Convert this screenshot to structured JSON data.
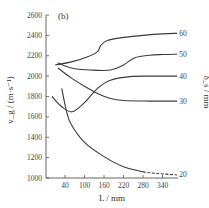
{
  "chart_data": {
    "type": "line",
    "panel_label": "(b)",
    "title": "",
    "xlabel": "L / mm",
    "ylabel": "v_g / (m·s⁻¹)",
    "right_label": "δ_s / mm",
    "xlim": [
      -20,
      380
    ],
    "ylim": [
      1000,
      2600
    ],
    "x_ticks": [
      40,
      100,
      160,
      220,
      280,
      340
    ],
    "y_ticks": [
      1000,
      1200,
      1400,
      1600,
      1800,
      2000,
      2200,
      2400,
      2600
    ],
    "grid": false,
    "legend_position": "inline-right",
    "series": [
      {
        "name": "60",
        "x": [
          10,
          60,
          110,
          140,
          150,
          170,
          220,
          280,
          340,
          385
        ],
        "values": [
          2110,
          2140,
          2190,
          2240,
          2300,
          2350,
          2380,
          2400,
          2415,
          2420
        ]
      },
      {
        "name": "50",
        "x": [
          18,
          60,
          120,
          180,
          220,
          255,
          300,
          340,
          385
        ],
        "values": [
          2130,
          2080,
          2060,
          2060,
          2110,
          2180,
          2205,
          2212,
          2215
        ]
      },
      {
        "name": "40",
        "x": [
          0,
          30,
          62,
          100,
          140,
          180,
          240,
          300,
          385
        ],
        "values": [
          1800,
          1700,
          1650,
          1740,
          1880,
          1960,
          1995,
          2000,
          2000
        ]
      },
      {
        "name": "30",
        "x": [
          18,
          60,
          100,
          140,
          180,
          220,
          300,
          385
        ],
        "values": [
          2080,
          1980,
          1900,
          1830,
          1780,
          1760,
          1755,
          1755
        ]
      },
      {
        "name": "20",
        "x": [
          30,
          45,
          60,
          100,
          160,
          220,
          280,
          320,
          385
        ],
        "values": [
          1880,
          1650,
          1520,
          1350,
          1210,
          1110,
          1060,
          1045,
          1030
        ],
        "dashed_from_x": 280
      }
    ]
  }
}
